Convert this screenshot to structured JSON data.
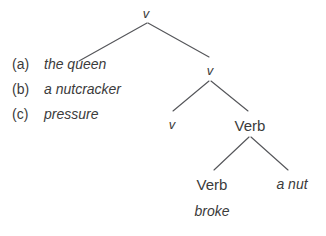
{
  "figure": {
    "type": "syntax-tree-diagram",
    "background_color": "#ffffff",
    "line_color": "#55565a",
    "text_color": "#3b3b3b"
  },
  "alternatives": [
    {
      "marker": "(a)",
      "text": "the queen"
    },
    {
      "marker": "(b)",
      "text": "a nutcracker"
    },
    {
      "marker": "(c)",
      "text": "pressure"
    }
  ],
  "tree": {
    "nodes": [
      {
        "id": "root_v",
        "label": "v",
        "style": "italic",
        "x": 146,
        "y": 13
      },
      {
        "id": "v2",
        "label": "v",
        "style": "italic",
        "x": 210,
        "y": 70
      },
      {
        "id": "v3",
        "label": "v",
        "style": "italic",
        "x": 172,
        "y": 124
      },
      {
        "id": "verb_upper",
        "label": "Verb",
        "style": "upright",
        "x": 250,
        "y": 125
      },
      {
        "id": "verb_lower",
        "label": "Verb",
        "style": "upright",
        "x": 212,
        "y": 184
      },
      {
        "id": "a_nut",
        "label": "a nut",
        "style": "italic",
        "x": 292,
        "y": 184
      },
      {
        "id": "broke",
        "label": "broke",
        "style": "italic",
        "x": 212,
        "y": 211
      }
    ],
    "edges": [
      {
        "from": "root_v",
        "to": "the-queen-slot",
        "x1": 147,
        "y1": 23,
        "x2": 79,
        "y2": 61
      },
      {
        "from": "root_v",
        "to": "v2",
        "x1": 148,
        "y1": 23,
        "x2": 209,
        "y2": 57
      },
      {
        "from": "v2",
        "to": "v3",
        "x1": 209,
        "y1": 81,
        "x2": 173,
        "y2": 111
      },
      {
        "from": "v2",
        "to": "verb_upper",
        "x1": 211,
        "y1": 81,
        "x2": 248,
        "y2": 111
      },
      {
        "from": "verb_upper",
        "to": "verb_lower",
        "x1": 249,
        "y1": 137,
        "x2": 214,
        "y2": 170
      },
      {
        "from": "verb_upper",
        "to": "a_nut",
        "x1": 251,
        "y1": 137,
        "x2": 288,
        "y2": 170
      }
    ]
  }
}
